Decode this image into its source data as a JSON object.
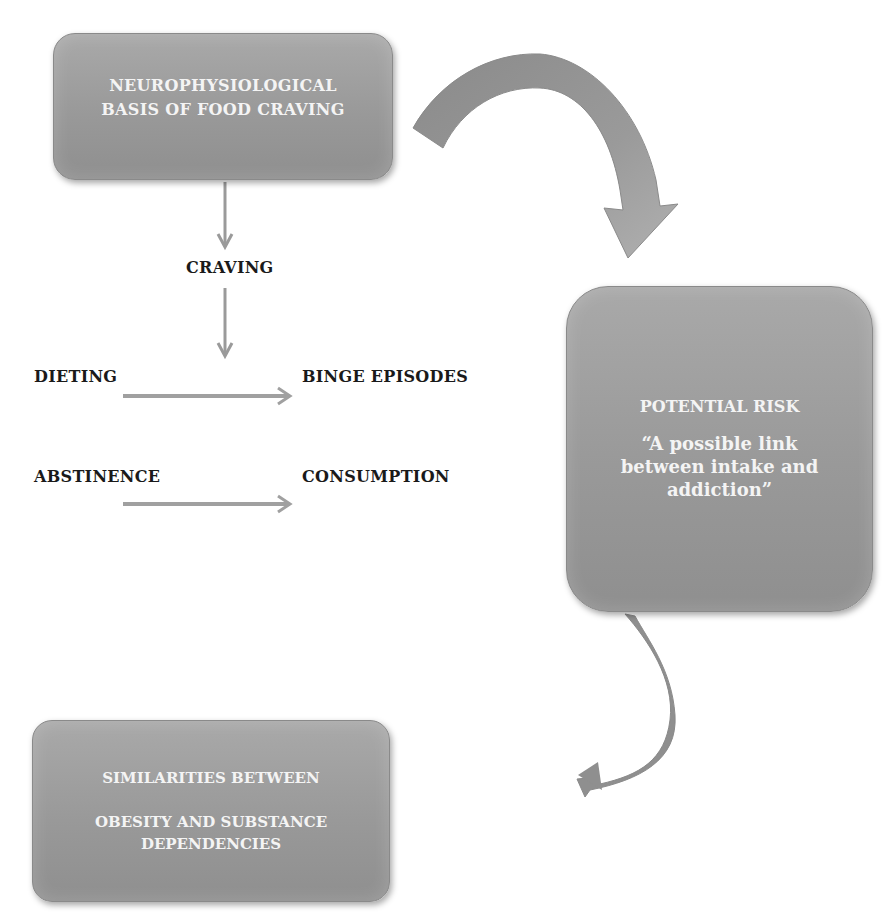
{
  "diagram": {
    "boxes": {
      "top": {
        "lines": [
          "NEUROPHYSIOLOGICAL",
          "BASIS OF FOOD CRAVING"
        ]
      },
      "right": {
        "title": "POTENTIAL RISK",
        "quote": [
          "“A possible link",
          "between intake and",
          "addiction”"
        ]
      },
      "bottom": {
        "lines": [
          "SIMILARITIES BETWEEN",
          "OBESITY AND SUBSTANCE DEPENDENCIES"
        ]
      }
    },
    "labels": {
      "craving": "CRAVING",
      "dieting": "DIETING",
      "binge": "BINGE EPISODES",
      "abstinence": "ABSTINENCE",
      "consumption": "CONSUMPTION"
    },
    "edges": [
      {
        "from": "NEUROPHYSIOLOGICAL BASIS OF FOOD CRAVING",
        "to": "CRAVING",
        "type": "straight-arrow"
      },
      {
        "from": "CRAVING",
        "to": "DIETING / BINGE EPISODES",
        "type": "straight-arrow"
      },
      {
        "from": "DIETING",
        "to": "BINGE EPISODES",
        "type": "straight-arrow"
      },
      {
        "from": "ABSTINENCE",
        "to": "CONSUMPTION",
        "type": "straight-arrow"
      },
      {
        "from": "NEUROPHYSIOLOGICAL BASIS OF FOOD CRAVING",
        "to": "POTENTIAL RISK",
        "type": "curved-arrow"
      },
      {
        "from": "POTENTIAL RISK",
        "to": "SIMILARITIES BETWEEN OBESITY AND SUBSTANCE DEPENDENCIES",
        "type": "curved-arrow"
      }
    ],
    "colors": {
      "box_fill": "#999999",
      "box_text": "#f4f4f4",
      "label_text": "#1a1a1a",
      "arrow": "#9a9a9a",
      "curved_arrow": "#8c8c8c"
    }
  }
}
